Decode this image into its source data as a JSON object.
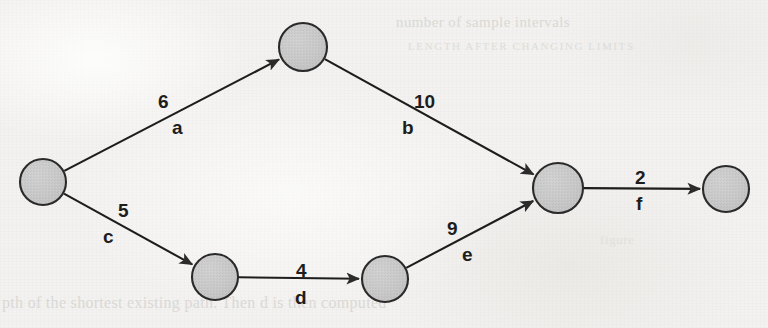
{
  "document": {
    "type": "scanned-textbook-figure",
    "figure_kind": "weighted-directed-graph",
    "background_color": "#f3f2f0",
    "ink_color": "#1d1d1d",
    "node_fill": "#c8c8c8",
    "node_stroke": "#2a2a2a",
    "bleed_text_color": "#d7d5d2"
  },
  "bleed_through": {
    "top_line_1": "number of sample intervals",
    "top_line_2": "LENGTH AFTER CHANGING LIMITS",
    "middle_right": "figure",
    "bottom_line": "pth of the shortest existing path. Then d is then computed"
  },
  "graph": {
    "directed": true,
    "node_radius": 23,
    "nodes": [
      {
        "id": "n0",
        "label": "",
        "cx": 43,
        "cy": 182,
        "r": 23
      },
      {
        "id": "n1",
        "label": "",
        "cx": 303,
        "cy": 47,
        "r": 24
      },
      {
        "id": "n2",
        "label": "",
        "cx": 215,
        "cy": 277,
        "r": 23
      },
      {
        "id": "n3",
        "label": "",
        "cx": 385,
        "cy": 279,
        "r": 23
      },
      {
        "id": "n4",
        "label": "",
        "cx": 558,
        "cy": 188,
        "r": 25
      },
      {
        "id": "n5",
        "label": "",
        "cx": 726,
        "cy": 189,
        "r": 23
      }
    ],
    "edges": [
      {
        "id": "a",
        "name": "a",
        "weight": "6",
        "from": "n0",
        "to": "n1",
        "weight_x": 158,
        "weight_y": 91,
        "name_x": 172,
        "name_y": 117
      },
      {
        "id": "b",
        "name": "b",
        "weight": "10",
        "from": "n1",
        "to": "n4",
        "weight_x": 414,
        "weight_y": 91,
        "name_x": 402,
        "name_y": 117
      },
      {
        "id": "c",
        "name": "c",
        "weight": "5",
        "from": "n0",
        "to": "n2",
        "weight_x": 118,
        "weight_y": 200,
        "name_x": 103,
        "name_y": 226
      },
      {
        "id": "d",
        "name": "d",
        "weight": "4",
        "from": "n2",
        "to": "n3",
        "weight_x": 296,
        "weight_y": 260,
        "name_x": 295,
        "name_y": 287
      },
      {
        "id": "e",
        "name": "e",
        "weight": "9",
        "from": "n3",
        "to": "n4",
        "weight_x": 447,
        "weight_y": 218,
        "name_x": 462,
        "name_y": 244
      },
      {
        "id": "f",
        "name": "f",
        "weight": "2",
        "from": "n4",
        "to": "n5",
        "weight_x": 635,
        "weight_y": 167,
        "name_x": 636,
        "name_y": 193
      }
    ]
  }
}
